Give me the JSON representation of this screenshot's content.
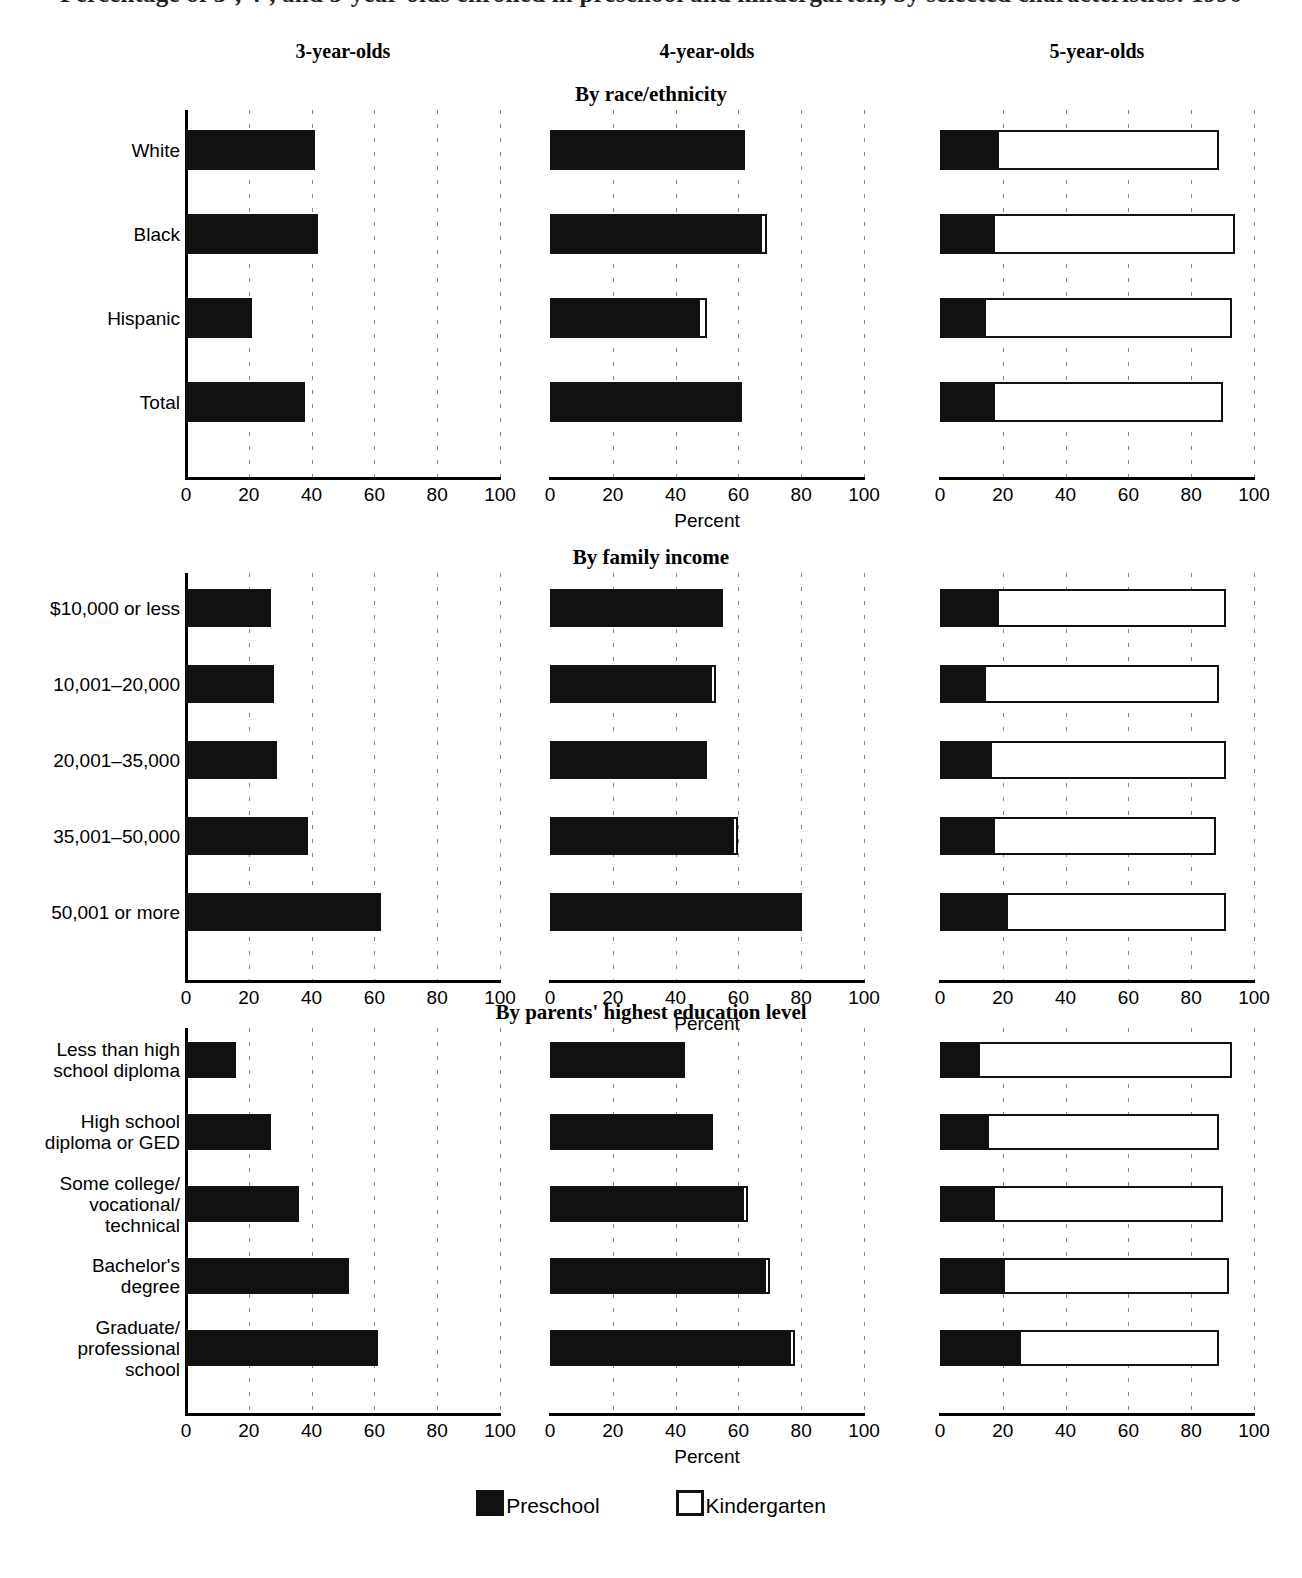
{
  "header": {
    "main_title": "Percentage of 3-, 4-, and 5-year-olds enrolled in preschool and kindergarten, by selected characteristics: 1996",
    "columns": [
      "3-year-olds",
      "4-year-olds",
      "5-year-olds"
    ]
  },
  "axis": {
    "title": "Percent",
    "ticks": [
      0,
      20,
      40,
      60,
      80,
      100
    ],
    "min": 0,
    "max": 100
  },
  "legend": {
    "items": [
      {
        "label": "Preschool",
        "style": "filled",
        "color": "#111111"
      },
      {
        "label": "Kindergarten",
        "style": "outline",
        "color": "#ffffff"
      }
    ]
  },
  "sections": [
    {
      "title": "By race/ethnicity",
      "categories": [
        "White",
        "Black",
        "Hispanic",
        "Total"
      ]
    },
    {
      "title": "By family income",
      "categories": [
        "$10,000 or less",
        "10,001–20,000",
        "20,001–35,000",
        "35,001–50,000",
        "50,001 or more"
      ]
    },
    {
      "title": "By parents' highest education level",
      "categories": [
        "Less than high\nschool diploma",
        "High school\ndiploma or GED",
        "Some college/\nvocational/\ntechnical",
        "Bachelor's\ndegree",
        "Graduate/\nprofessional\nschool"
      ]
    }
  ],
  "chart_data": [
    {
      "type": "bar",
      "title": "By race/ethnicity",
      "xlabel": "Percent",
      "ylabel": "",
      "xlim": [
        0,
        100
      ],
      "orientation": "horizontal",
      "stacked": true,
      "grid": "vertical-dashed",
      "legend_position": "bottom",
      "categories": [
        "White",
        "Black",
        "Hispanic",
        "Total"
      ],
      "panels": [
        {
          "name": "3-year-olds",
          "series": [
            {
              "name": "Preschool",
              "values": [
                41,
                42,
                21,
                38
              ]
            },
            {
              "name": "Kindergarten",
              "values": [
                0,
                0,
                0,
                0
              ]
            }
          ]
        },
        {
          "name": "4-year-olds",
          "series": [
            {
              "name": "Preschool",
              "values": [
                62,
                67,
                47,
                60
              ]
            },
            {
              "name": "Kindergarten",
              "values": [
                0,
                2,
                3,
                1
              ]
            }
          ]
        },
        {
          "name": "5-year-olds",
          "series": [
            {
              "name": "Preschool",
              "values": [
                18,
                17,
                14,
                17
              ]
            },
            {
              "name": "Kindergarten",
              "values": [
                71,
                77,
                79,
                73
              ]
            }
          ]
        }
      ]
    },
    {
      "type": "bar",
      "title": "By family income",
      "xlabel": "Percent",
      "ylabel": "",
      "xlim": [
        0,
        100
      ],
      "orientation": "horizontal",
      "stacked": true,
      "grid": "vertical-dashed",
      "legend_position": "bottom",
      "categories": [
        "$10,000 or less",
        "10,001–20,000",
        "20,001–35,000",
        "35,001–50,000",
        "50,001 or more"
      ],
      "panels": [
        {
          "name": "3-year-olds",
          "series": [
            {
              "name": "Preschool",
              "values": [
                27,
                28,
                29,
                39,
                62
              ]
            },
            {
              "name": "Kindergarten",
              "values": [
                0,
                0,
                0,
                0,
                0
              ]
            }
          ]
        },
        {
          "name": "4-year-olds",
          "series": [
            {
              "name": "Preschool",
              "values": [
                55,
                51,
                50,
                58,
                79
              ]
            },
            {
              "name": "Kindergarten",
              "values": [
                0,
                2,
                0,
                2,
                1
              ]
            }
          ]
        },
        {
          "name": "5-year-olds",
          "series": [
            {
              "name": "Preschool",
              "values": [
                18,
                14,
                16,
                17,
                21
              ]
            },
            {
              "name": "Kindergarten",
              "values": [
                73,
                75,
                75,
                71,
                70
              ]
            }
          ]
        }
      ]
    },
    {
      "type": "bar",
      "title": "By parents' highest education level",
      "xlabel": "Percent",
      "ylabel": "",
      "xlim": [
        0,
        100
      ],
      "orientation": "horizontal",
      "stacked": true,
      "grid": "vertical-dashed",
      "legend_position": "bottom",
      "categories": [
        "Less than high school diploma",
        "High school diploma or GED",
        "Some college/vocational/technical",
        "Bachelor's degree",
        "Graduate/professional school"
      ],
      "panels": [
        {
          "name": "3-year-olds",
          "series": [
            {
              "name": "Preschool",
              "values": [
                16,
                27,
                36,
                52,
                61
              ]
            },
            {
              "name": "Kindergarten",
              "values": [
                0,
                0,
                0,
                0,
                0
              ]
            }
          ]
        },
        {
          "name": "4-year-olds",
          "series": [
            {
              "name": "Preschool",
              "values": [
                43,
                52,
                61,
                68,
                76
              ]
            },
            {
              "name": "Kindergarten",
              "values": [
                0,
                0,
                2,
                2,
                2
              ]
            }
          ]
        },
        {
          "name": "5-year-olds",
          "series": [
            {
              "name": "Preschool",
              "values": [
                12,
                15,
                17,
                20,
                25
              ]
            },
            {
              "name": "Kindergarten",
              "values": [
                81,
                74,
                73,
                72,
                64
              ]
            }
          ]
        }
      ]
    }
  ]
}
